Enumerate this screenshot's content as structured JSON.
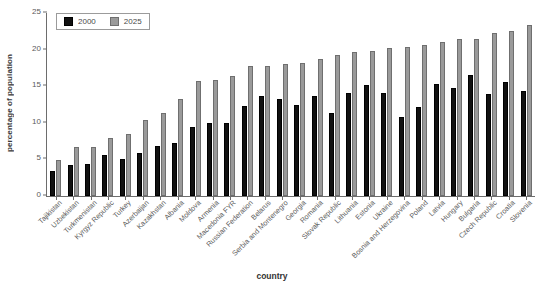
{
  "chart_data": {
    "type": "bar",
    "title": "",
    "xlabel": "country",
    "ylabel": "percentage of population",
    "ylim": [
      0,
      25
    ],
    "yticks": [
      0,
      5,
      10,
      15,
      20,
      25
    ],
    "grid": false,
    "legend_position": "top-left",
    "categories": [
      "Tajikistan",
      "Uzbekistan",
      "Turkmenistan",
      "Kyrgyz Republic",
      "Turkey",
      "Azerbaijan",
      "Kazakhstan",
      "Albania",
      "Moldova",
      "Armenia",
      "Macedonia FYR",
      "Russian Federation",
      "Belarus",
      "Serbia and Montenegro",
      "Georgia",
      "Romania",
      "Slovak Republic",
      "Lithuania",
      "Estonia",
      "Ukraine",
      "Bosnia and Herzegovina",
      "Poland",
      "Latvia",
      "Hungary",
      "Bulgaria",
      "Czech Republic",
      "Croatia",
      "Slovenia"
    ],
    "series": [
      {
        "name": "2000",
        "color": "#111111",
        "values": [
          3.4,
          4.3,
          4.4,
          5.6,
          5.1,
          5.9,
          6.9,
          7.3,
          9.4,
          10.0,
          10.0,
          12.3,
          13.7,
          13.2,
          12.5,
          13.6,
          11.4,
          14.1,
          15.2,
          14.1,
          10.8,
          12.1,
          15.3,
          14.8,
          16.5,
          13.9,
          15.6,
          14.3
        ]
      },
      {
        "name": "2025",
        "color": "#9a9a9a",
        "values": [
          4.9,
          6.7,
          6.7,
          7.9,
          8.5,
          10.4,
          11.4,
          13.2,
          15.7,
          15.8,
          16.4,
          17.7,
          17.7,
          18.0,
          18.2,
          18.7,
          19.2,
          19.7,
          19.8,
          20.2,
          20.3,
          20.6,
          21.1,
          21.4,
          21.5,
          22.3,
          22.6,
          23.3
        ]
      }
    ]
  },
  "legend": {
    "entries": [
      {
        "label": "2000"
      },
      {
        "label": "2025"
      }
    ]
  },
  "axes": {
    "x_title": "country",
    "y_title": "percentage of population"
  },
  "caption": {
    "cropped_text": ""
  }
}
